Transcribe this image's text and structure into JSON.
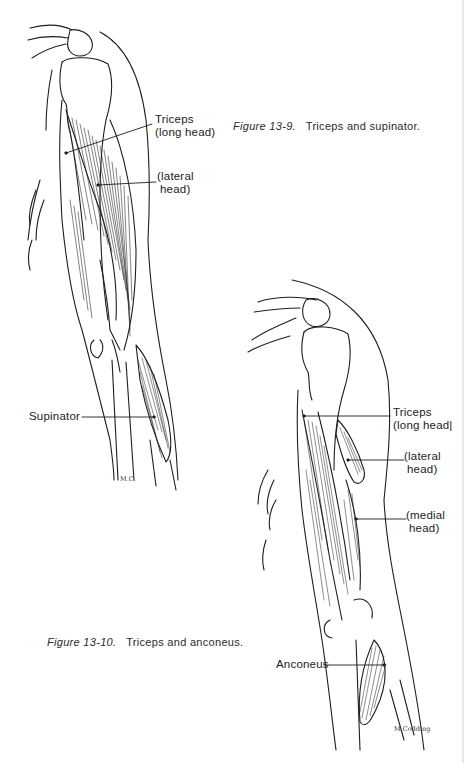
{
  "figures": [
    {
      "id_label": "Figure 13-9.",
      "caption_text": "Triceps and supinator.",
      "labels": {
        "triceps_long_1": "Triceps",
        "triceps_long_2": "(long head)",
        "lateral_1": "(lateral",
        "lateral_2": "head)",
        "supinator": "Supinator"
      },
      "signature": "M.C."
    },
    {
      "id_label": "Figure 13-10.",
      "caption_text": "Triceps and anconeus.",
      "labels": {
        "triceps_long_1": "Triceps",
        "triceps_long_2": "(long head|",
        "lateral_1": "(lateral",
        "lateral_2": "head)",
        "medial_1": "(medial",
        "medial_2": "head)",
        "anconeus": "Anconeus"
      },
      "signature": "M.Codding"
    }
  ]
}
